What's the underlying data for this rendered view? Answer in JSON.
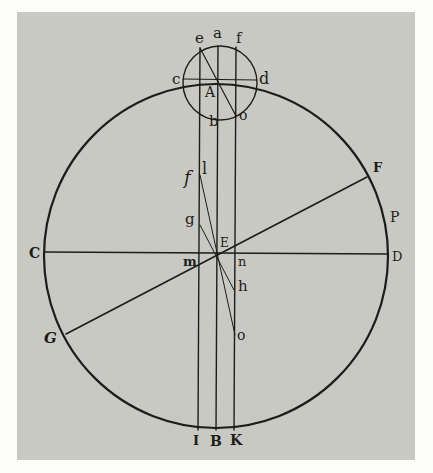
{
  "figure": {
    "colors": {
      "page": "#c9c9c4",
      "margin": "#fdfdfb",
      "ink": "#1c1c1a"
    },
    "labels": {
      "top_a": "a",
      "top_e": "e",
      "top_f": "f",
      "small_c": "c",
      "small_d": "d",
      "center_A": "A",
      "small_b": "b",
      "small_o": "o",
      "left_f": "f",
      "l": "l",
      "g": "g",
      "E": "E",
      "m": "m",
      "n": "n",
      "h": "h",
      "lower_o": "o",
      "C": "C",
      "D": "D",
      "F": "F",
      "P": "P",
      "G": "G",
      "I": "I",
      "B": "B",
      "K": "K"
    }
  }
}
